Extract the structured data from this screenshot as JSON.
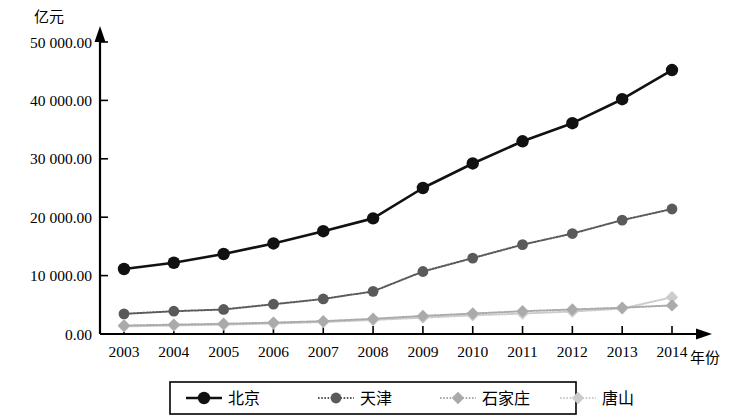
{
  "chart_data": {
    "type": "line",
    "title": "",
    "subtitle": "",
    "ylabel": "亿元",
    "xlabel": "年份",
    "categories": [
      "2003",
      "2004",
      "2005",
      "2006",
      "2007",
      "2008",
      "2009",
      "2010",
      "2011",
      "2012",
      "2013",
      "2014"
    ],
    "x": [
      2003,
      2004,
      2005,
      2006,
      2007,
      2008,
      2009,
      2010,
      2011,
      2012,
      2013,
      2014
    ],
    "ylim": [
      0,
      50000
    ],
    "ytick_values": [
      0,
      10000,
      20000,
      30000,
      40000,
      50000
    ],
    "ytick_labels": [
      "0.00",
      "10 000.00",
      "20 000.00",
      "30 000.00",
      "40 000.00",
      "50 000.00"
    ],
    "grid": false,
    "legend_position": "bottom",
    "series": [
      {
        "name": "北京",
        "color": "#111111",
        "marker": "circle",
        "linestyle": "solid",
        "values": [
          11130,
          12200,
          13700,
          15500,
          17600,
          19800,
          25000,
          29200,
          33000,
          36100,
          40200,
          45200
        ]
      },
      {
        "name": "天津",
        "color": "#5a5a5a",
        "marker": "circle",
        "linestyle": "dotted",
        "values": [
          3450,
          3900,
          4200,
          5100,
          6000,
          7300,
          10700,
          13000,
          15300,
          17200,
          19500,
          21400
        ]
      },
      {
        "name": "石家庄",
        "color": "#aaaaaa",
        "marker": "diamond",
        "linestyle": "dotted",
        "values": [
          1450,
          1600,
          1750,
          1950,
          2200,
          2600,
          3100,
          3500,
          3900,
          4200,
          4500,
          4900
        ]
      },
      {
        "name": "唐山",
        "color": "#cccccc",
        "marker": "diamond",
        "linestyle": "dotted",
        "values": [
          1300,
          1450,
          1600,
          1800,
          2050,
          2400,
          2800,
          3200,
          3500,
          3850,
          4350,
          6300
        ]
      }
    ]
  },
  "legend": {
    "items": [
      {
        "label": "北京"
      },
      {
        "label": "天津"
      },
      {
        "label": "石家庄"
      },
      {
        "label": "唐山"
      }
    ]
  },
  "axes": {
    "y_unit_label": "亿元",
    "x_unit_label": "年份"
  }
}
